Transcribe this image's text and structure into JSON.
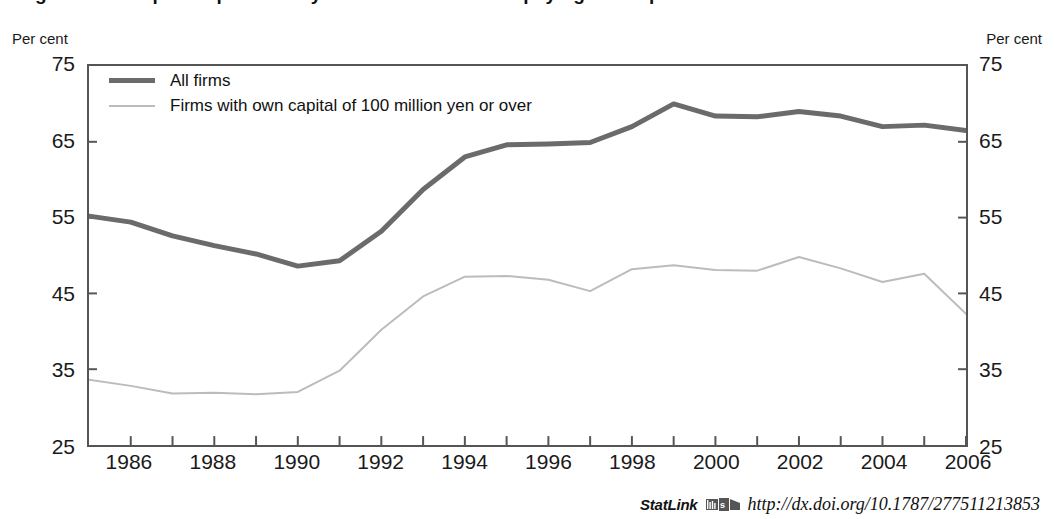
{
  "figure": {
    "title": "Figure 1.9. Corporate profitability and the ratio of firms paying no corporate income tax"
  },
  "axes": {
    "unit_left": "Per cent",
    "unit_right": "Per cent",
    "y_ticks": [
      25,
      35,
      45,
      55,
      65,
      75
    ],
    "x_ticks": [
      1986,
      1988,
      1990,
      1992,
      1994,
      1996,
      1998,
      2000,
      2002,
      2004,
      2006
    ]
  },
  "legend": {
    "items": [
      {
        "key": "all_firms",
        "label": "All firms",
        "color": "#6b6b6b"
      },
      {
        "key": "large_firms",
        "label": "Firms with own capital of 100 million yen or over",
        "color": "#bcbcbc"
      }
    ]
  },
  "statlink": {
    "word": "StatLink",
    "icon": "statlink-icon",
    "url": "http://dx.doi.org/10.1787/277511213853"
  },
  "chart_data": {
    "type": "line",
    "title": "Figure 1.9. Corporate profitability and the ratio of firms paying no corporate income tax",
    "xlabel": "",
    "ylabel": "Per cent",
    "xlim": [
      1985,
      2006
    ],
    "ylim": [
      25,
      75
    ],
    "grid": false,
    "legend_position": "top-left",
    "x": [
      1985,
      1986,
      1987,
      1988,
      1989,
      1990,
      1991,
      1992,
      1993,
      1994,
      1995,
      1996,
      1997,
      1998,
      1999,
      2000,
      2001,
      2002,
      2003,
      2004,
      2005,
      2006
    ],
    "series": [
      {
        "name": "All firms",
        "color": "#6b6b6b",
        "width": 5,
        "values": [
          55.2,
          54.4,
          52.6,
          51.3,
          50.2,
          48.6,
          49.3,
          53.2,
          58.7,
          63.0,
          64.6,
          64.7,
          64.9,
          67.0,
          70.0,
          68.4,
          68.3,
          69.0,
          68.4,
          67.0,
          67.2,
          66.5
        ]
      },
      {
        "name": "Firms with own capital of 100 million yen or over",
        "color": "#bcbcbc",
        "width": 2,
        "values": [
          33.6,
          32.8,
          31.8,
          31.9,
          31.7,
          32.0,
          34.8,
          40.2,
          44.6,
          47.2,
          47.3,
          46.8,
          45.3,
          48.2,
          48.7,
          48.1,
          48.0,
          49.8,
          48.3,
          46.5,
          47.6,
          42.3
        ]
      }
    ]
  }
}
